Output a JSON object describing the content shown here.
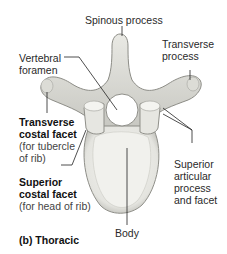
{
  "figure": {
    "caption": "(b) Thoracic"
  },
  "labels": {
    "spinous_process": "Spinous process",
    "transverse_process_1": "Transverse",
    "transverse_process_2": "process",
    "vertebral_foramen_1": "Vertebral",
    "vertebral_foramen_2": "foramen",
    "transverse_costal_facet_1": "Transverse",
    "transverse_costal_facet_2": "costal facet",
    "transverse_costal_facet_note_1": "(for tubercle",
    "transverse_costal_facet_note_2": "of rib)",
    "superior_costal_facet_1": "Superior",
    "superior_costal_facet_2": "costal facet",
    "superior_costal_facet_note": "(for head of rib)",
    "superior_articular_1": "Superior",
    "superior_articular_2": "articular",
    "superior_articular_3": "process",
    "superior_articular_4": "and facet",
    "body": "Body"
  },
  "colors": {
    "bone_light": "#f2f2ee",
    "bone_mid": "#d6d6d0",
    "bone_dark": "#9a9a94",
    "leader_line": "#222222"
  }
}
